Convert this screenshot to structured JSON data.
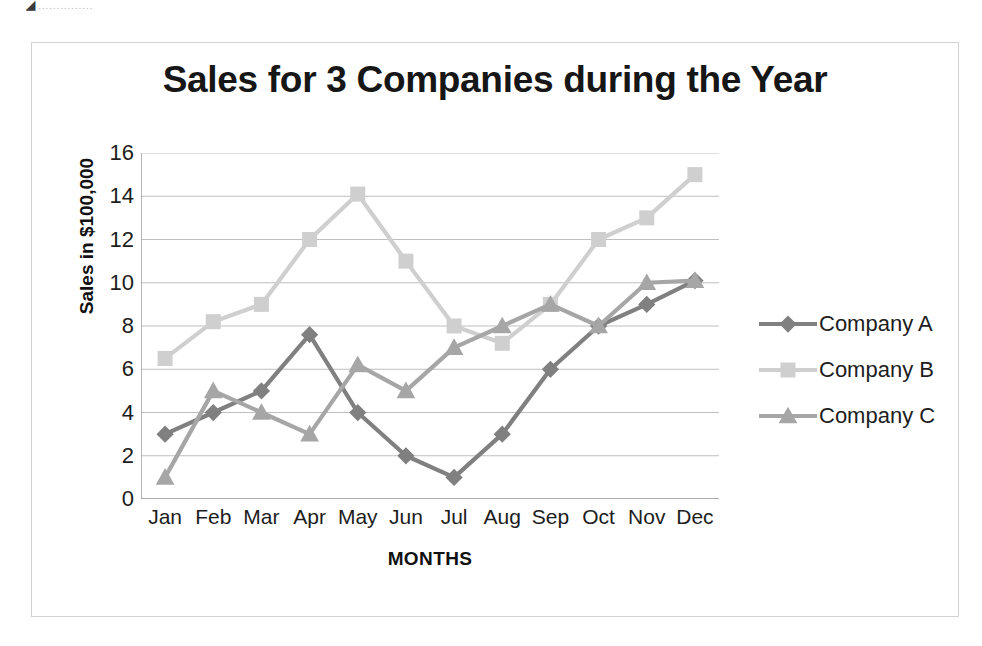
{
  "artifact": {
    "glyph": "◢",
    "text": "……………"
  },
  "chart_data": {
    "type": "line",
    "title": "Sales for 3 Companies during the Year",
    "xlabel": "MONTHS",
    "ylabel": "Sales in $100,000",
    "categories": [
      "Jan",
      "Feb",
      "Mar",
      "Apr",
      "May",
      "Jun",
      "Jul",
      "Aug",
      "Sep",
      "Oct",
      "Nov",
      "Dec"
    ],
    "yticks": [
      0,
      2,
      4,
      6,
      8,
      10,
      12,
      14,
      16
    ],
    "ylim": [
      0,
      16
    ],
    "grid": true,
    "legend_position": "right",
    "series": [
      {
        "name": "Company A",
        "marker": "diamond",
        "color": "#808080",
        "values": [
          3,
          4,
          5,
          7.6,
          4,
          2,
          1,
          3,
          6,
          8,
          9,
          10.1
        ]
      },
      {
        "name": "Company B",
        "marker": "square",
        "color": "#cfcfcf",
        "values": [
          6.5,
          8.2,
          9,
          12,
          14.1,
          11,
          8,
          7.2,
          9,
          12,
          13,
          15
        ]
      },
      {
        "name": "Company C",
        "marker": "triangle",
        "color": "#a6a6a6",
        "values": [
          1,
          5,
          4,
          3,
          6.2,
          5,
          7,
          8,
          9,
          8,
          10,
          10.1
        ]
      }
    ]
  }
}
